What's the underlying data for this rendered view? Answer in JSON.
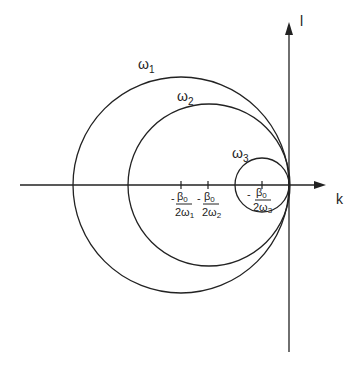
{
  "axes": {
    "horizontal_label": "k",
    "vertical_label": "l"
  },
  "circles": [
    {
      "id": "w1",
      "label": "ω",
      "subscript": "1",
      "cx": 181,
      "cy": 185,
      "r": 108
    },
    {
      "id": "w2",
      "label": "ω",
      "subscript": "2",
      "cx": 209,
      "cy": 185,
      "r": 81
    },
    {
      "id": "w3",
      "label": "ω",
      "subscript": "3",
      "cx": 262,
      "cy": 185,
      "r": 27
    }
  ],
  "ticks": [
    {
      "x": 181,
      "minus": "-",
      "numerator": "β",
      "num_sub": "0",
      "denominator": "2ω",
      "den_sub": "1"
    },
    {
      "x": 208,
      "minus": "-",
      "numerator": "β",
      "num_sub": "0",
      "denominator": "2ω",
      "den_sub": "2"
    },
    {
      "x": 262,
      "minus": "-",
      "numerator": "β",
      "num_sub": "0",
      "denominator": "2ω",
      "den_sub": "3"
    }
  ],
  "colors": {
    "stroke": "#222222",
    "background": "#ffffff"
  }
}
